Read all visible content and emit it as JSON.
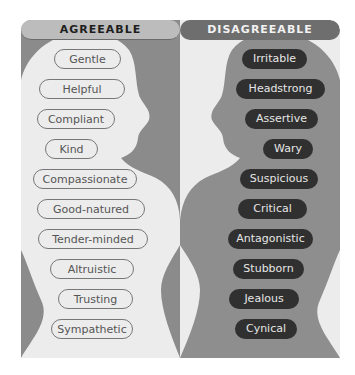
{
  "colors": {
    "left_bg": "#8b8b8b",
    "left_silhouette": "#ececec",
    "right_bg": "#ececec",
    "right_silhouette": "#8e8e8e",
    "dark_pill": "#303030"
  },
  "agreeable": {
    "title": "AGREEABLE",
    "traits": [
      "Gentle",
      "Helpful",
      "Compliant",
      "Kind",
      "Compassionate",
      "Good-natured",
      "Tender-minded",
      "Altruistic",
      "Trusting",
      "Sympathetic"
    ]
  },
  "disagreeable": {
    "title": "DISAGREEABLE",
    "traits": [
      "Irritable",
      "Headstrong",
      "Assertive",
      "Wary",
      "Suspicious",
      "Critical",
      "Antagonistic",
      "Stubborn",
      "Jealous",
      "Cynical"
    ]
  }
}
